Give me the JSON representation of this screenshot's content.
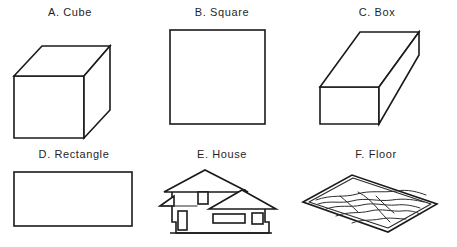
{
  "sheet": {
    "background_color": "#ffffff",
    "line_color": "#1a1a1a",
    "text_color": "#1f1f1f",
    "columns": 3,
    "rows": 2
  },
  "figures": [
    {
      "key": "cube",
      "label": "A.  Cube",
      "letter": "A.",
      "name": "Cube",
      "shape_type": "3d-cube",
      "row": 1,
      "column": 1
    },
    {
      "key": "square",
      "label": "B.  Square",
      "letter": "B.",
      "name": "Square",
      "shape_type": "2d-square",
      "row": 1,
      "column": 2
    },
    {
      "key": "box",
      "label": "C.  Box",
      "letter": "C.",
      "name": "Box",
      "shape_type": "3d-rectangular-prism",
      "row": 1,
      "column": 3
    },
    {
      "key": "rectangle",
      "label": "D.  Rectangle",
      "letter": "D.",
      "name": "Rectangle",
      "shape_type": "2d-rectangle",
      "row": 2,
      "column": 1
    },
    {
      "key": "house",
      "label": "E.  House",
      "letter": "E.",
      "name": "House",
      "shape_type": "house-elevation",
      "row": 2,
      "column": 2
    },
    {
      "key": "floor",
      "label": "F.  Floor",
      "letter": "F.",
      "name": "Floor",
      "shape_type": "wood-floor-plane",
      "row": 2,
      "column": 3
    }
  ]
}
